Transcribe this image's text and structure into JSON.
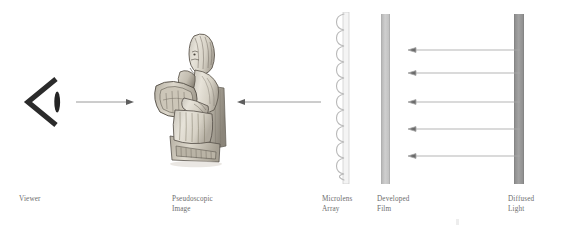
{
  "figure": {
    "background_color": "#ffffff"
  },
  "labels": {
    "viewer": "Viewer",
    "pseudoscopic_image": "Pseudoscopic\nImage",
    "microlens_array": "Microlens\nArray",
    "developed_film": "Developed\nFilm",
    "diffused_light": "Diffused\nLight"
  },
  "elements": {
    "viewer_glyph": {
      "icon": "viewer-eye-chevron-icon",
      "color": "#2b2b2b"
    },
    "arrow_viewer_to_image": {
      "icon": "arrow-right-icon",
      "direction": "right",
      "color": "#8c8c8c"
    },
    "arrow_array_to_image": {
      "icon": "arrow-left-icon",
      "direction": "left",
      "color": "#8c8c8c"
    },
    "microlens_array": {
      "icon": "lenslet-scallop-icon",
      "lenslet_count": 17,
      "color": "#bdbdbd"
    },
    "developed_film": {
      "icon": "film-bar-icon",
      "color": "#c4c4c4"
    },
    "diffused_light": {
      "icon": "light-panel-icon",
      "color": "#999999"
    },
    "light_rays": {
      "icon": "arrow-left-icon",
      "count": 5,
      "direction": "left",
      "color": "#a8a8a8"
    },
    "pseudoscopic_statue": {
      "icon": "seated-chess-figure-icon",
      "description": "Carved ivory seated figure"
    }
  }
}
